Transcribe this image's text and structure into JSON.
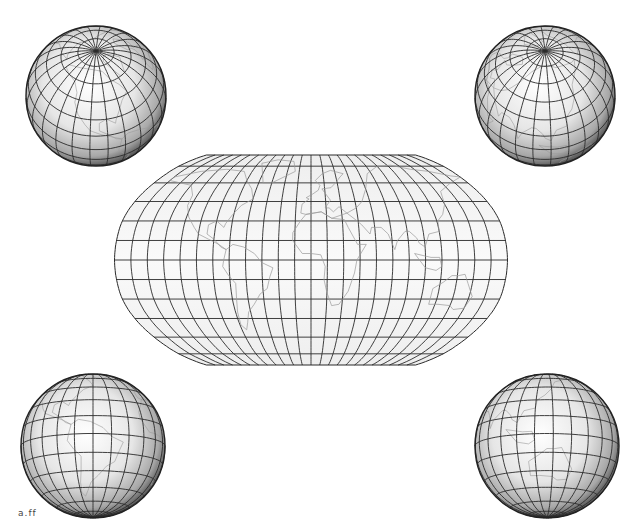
{
  "figure": {
    "background": "#ffffff",
    "grid_color": "#2a2a2a",
    "coast_color": "#9a9a9a",
    "land_fill": "#f2f2f2"
  },
  "central_map": {
    "projection": "Robinson",
    "graticule_step_deg": 15,
    "bounds": {
      "left": 113,
      "right": 506,
      "top": 155,
      "bottom": 365
    },
    "center_x": 311,
    "visible_regions": [
      "North America",
      "South America",
      "Europe",
      "Africa",
      "Asia",
      "Australia"
    ]
  },
  "globes": [
    {
      "id": "top-left",
      "cx": 96,
      "cy": 96,
      "r": 70,
      "view": "North pole tilted, North America",
      "pole": "north"
    },
    {
      "id": "top-right",
      "cx": 545,
      "cy": 96,
      "r": 70,
      "view": "North pole tilted, Asia",
      "pole": "north"
    },
    {
      "id": "bottom-left",
      "cx": 93,
      "cy": 446,
      "r": 72,
      "view": "South America",
      "pole": "south"
    },
    {
      "id": "bottom-right",
      "cx": 547,
      "cy": 446,
      "r": 72,
      "view": "Australia and Southeast Asia",
      "pole": "south"
    }
  ],
  "watermark": {
    "text": "a.ff"
  }
}
